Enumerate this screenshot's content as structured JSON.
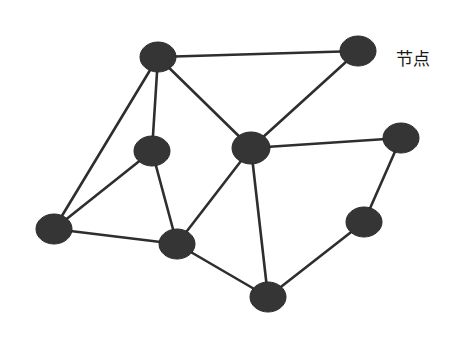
{
  "diagram": {
    "type": "network-graph",
    "label": {
      "text": "节点",
      "x": 396,
      "y": 45
    },
    "colors": {
      "background": "#ffffff",
      "node_fill": "#353535",
      "edge": "#2e2e2e",
      "text": "#1a1a1a"
    },
    "nodes": [
      {
        "id": "n1",
        "x": 158,
        "y": 57,
        "rx": 18,
        "ry": 15
      },
      {
        "id": "n2",
        "x": 358,
        "y": 51,
        "rx": 18,
        "ry": 15
      },
      {
        "id": "n3",
        "x": 152,
        "y": 151,
        "rx": 18,
        "ry": 15
      },
      {
        "id": "n4",
        "x": 251,
        "y": 148,
        "rx": 19,
        "ry": 16
      },
      {
        "id": "n5",
        "x": 401,
        "y": 138,
        "rx": 18,
        "ry": 15
      },
      {
        "id": "n6",
        "x": 54,
        "y": 229,
        "rx": 18,
        "ry": 15
      },
      {
        "id": "n7",
        "x": 177,
        "y": 244,
        "rx": 18,
        "ry": 15
      },
      {
        "id": "n8",
        "x": 364,
        "y": 222,
        "rx": 18,
        "ry": 15
      },
      {
        "id": "n9",
        "x": 268,
        "y": 297,
        "rx": 18,
        "ry": 15
      }
    ],
    "edges": [
      [
        "n1",
        "n2"
      ],
      [
        "n1",
        "n6"
      ],
      [
        "n1",
        "n3"
      ],
      [
        "n1",
        "n4"
      ],
      [
        "n2",
        "n4"
      ],
      [
        "n3",
        "n6"
      ],
      [
        "n3",
        "n7"
      ],
      [
        "n4",
        "n5"
      ],
      [
        "n4",
        "n7"
      ],
      [
        "n4",
        "n9"
      ],
      [
        "n5",
        "n8"
      ],
      [
        "n6",
        "n7"
      ],
      [
        "n7",
        "n9"
      ],
      [
        "n8",
        "n9"
      ]
    ]
  }
}
